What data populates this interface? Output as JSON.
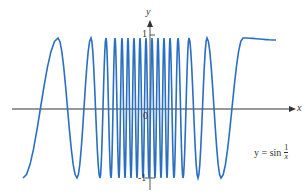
{
  "chart_data": {
    "type": "line",
    "title": "",
    "function_label": "y = sin 1/x",
    "xlabel": "x",
    "ylabel": "y",
    "ylim": [
      -1,
      1
    ],
    "yticks": [
      {
        "value": 1,
        "label": "1"
      },
      {
        "value": -1,
        "label": "-1"
      }
    ],
    "origin_label": "0",
    "series": [
      {
        "name": "y = sin(1/x)",
        "color": "#2a6fc1",
        "extrema_px": [
          [
            23,
            178
          ],
          [
            58,
            38
          ],
          [
            77,
            178
          ],
          [
            91,
            38
          ],
          [
            100,
            178
          ],
          [
            106,
            38
          ],
          [
            111,
            178
          ],
          [
            115,
            38
          ],
          [
            119,
            178
          ],
          [
            122,
            38
          ],
          [
            125,
            178
          ],
          [
            128,
            38
          ],
          [
            131,
            178
          ],
          [
            134,
            38
          ],
          [
            137,
            178
          ],
          [
            140,
            38
          ],
          [
            143,
            178
          ],
          [
            146,
            38
          ],
          [
            149,
            178
          ],
          [
            152,
            38
          ],
          [
            155,
            178
          ],
          [
            158,
            38
          ],
          [
            161,
            178
          ],
          [
            164,
            38
          ],
          [
            167,
            178
          ],
          [
            170,
            38
          ],
          [
            174,
            178
          ],
          [
            178,
            38
          ],
          [
            183,
            178
          ],
          [
            189,
            38
          ],
          [
            198,
            178
          ],
          [
            207,
            38
          ],
          [
            221,
            178
          ],
          [
            243,
            38
          ]
        ],
        "end_px": [
          276,
          40
        ]
      }
    ],
    "colors": {
      "curve": "#2a6fc1",
      "axis": "#333333"
    }
  },
  "labels": {
    "x_axis": "x",
    "y_axis": "y",
    "one": "1",
    "minus_one": "-1",
    "zero": "0",
    "eq_lhs": "y = sin",
    "eq_num": "1",
    "eq_den": "x"
  }
}
